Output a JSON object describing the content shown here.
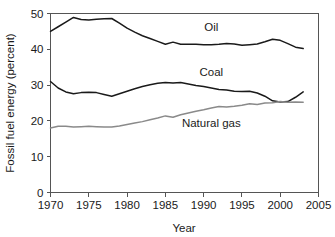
{
  "chart_data": {
    "type": "line",
    "title": "",
    "xlabel": "Year",
    "ylabel": "Fossil fuel energy (percent)",
    "xlim": [
      1970,
      2005
    ],
    "ylim": [
      0,
      50
    ],
    "xticks": [
      1970,
      1975,
      1980,
      1985,
      1990,
      1995,
      2000,
      2005
    ],
    "yticks": [
      0,
      10,
      20,
      30,
      40,
      50
    ],
    "grid": false,
    "legend_position": "inline-labels",
    "x": [
      1970,
      1971,
      1972,
      1973,
      1974,
      1975,
      1976,
      1977,
      1978,
      1979,
      1980,
      1981,
      1982,
      1983,
      1984,
      1985,
      1986,
      1987,
      1988,
      1989,
      1990,
      1991,
      1992,
      1993,
      1994,
      1995,
      1996,
      1997,
      1998,
      1999,
      2000,
      2001,
      2002,
      2003
    ],
    "series": [
      {
        "name": "Oil",
        "color": "#1a1a1a",
        "label_x": 1991,
        "label_y": 45.2,
        "values": [
          45.0,
          46.3,
          47.6,
          48.9,
          48.3,
          48.2,
          48.4,
          48.5,
          48.6,
          47.3,
          45.9,
          44.8,
          43.8,
          43.0,
          42.2,
          41.4,
          42.0,
          41.4,
          41.4,
          41.4,
          41.3,
          41.3,
          41.4,
          41.6,
          41.5,
          41.1,
          41.3,
          41.5,
          42.1,
          42.8,
          42.5,
          41.6,
          40.6,
          40.2
        ]
      },
      {
        "name": "Coal",
        "color": "#1a1a1a",
        "label_x": 1991,
        "label_y": 32.6,
        "values": [
          31.0,
          29.2,
          28.1,
          27.6,
          27.9,
          28.0,
          27.9,
          27.4,
          26.9,
          27.6,
          28.3,
          29.0,
          29.6,
          30.1,
          30.5,
          30.7,
          30.6,
          30.7,
          30.3,
          29.9,
          29.6,
          29.2,
          28.8,
          28.6,
          28.3,
          28.2,
          28.3,
          27.8,
          26.9,
          25.6,
          25.3,
          25.4,
          26.6,
          28.1
        ]
      },
      {
        "name": "Natural gas",
        "color": "#8a8a8a",
        "label_x": 1991,
        "label_y": 18.3,
        "values": [
          18.0,
          18.5,
          18.5,
          18.3,
          18.4,
          18.5,
          18.4,
          18.3,
          18.3,
          18.6,
          19.0,
          19.4,
          19.8,
          20.3,
          20.8,
          21.4,
          21.0,
          21.7,
          22.2,
          22.7,
          23.1,
          23.6,
          24.0,
          23.9,
          24.1,
          24.4,
          24.8,
          24.6,
          25.0,
          25.1,
          25.4,
          25.2,
          25.3,
          25.2
        ]
      }
    ]
  }
}
